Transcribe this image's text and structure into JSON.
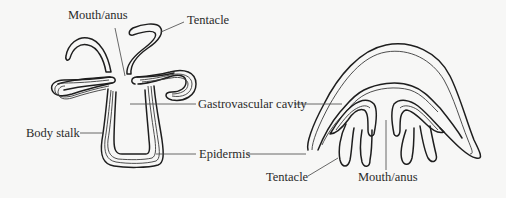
{
  "figure": {
    "left_organism": {
      "name": "polyp",
      "labels": {
        "mouth_anus": "Mouth/anus",
        "tentacle": "Tentacle",
        "gastrovascular_cavity": "Gastrovascular cavity",
        "body_stalk": "Body stalk",
        "epidermis": "Epidermis"
      }
    },
    "right_organism": {
      "name": "medusa",
      "labels": {
        "tentacle": "Tentacle",
        "mouth_anus": "Mouth/anus"
      }
    },
    "colors": {
      "background": "#f7f7f6",
      "line": "#1e1e1e",
      "text": "#2a2a2a"
    }
  }
}
